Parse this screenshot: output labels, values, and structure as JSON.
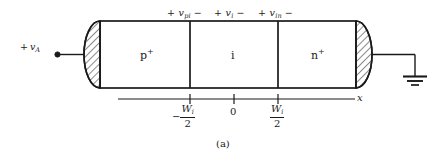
{
  "figure": {
    "caption": "(a)",
    "device": "PIN diode one-dimensional structure",
    "terminal_voltage": {
      "sign": "+",
      "symbol": "v",
      "subscript": "A"
    },
    "ground": {
      "name": "ground-symbol",
      "bars": 3
    },
    "regions": [
      {
        "id": "p-plus",
        "label": "p",
        "superscript": "+"
      },
      {
        "id": "intrinsic",
        "label": "i",
        "superscript": ""
      },
      {
        "id": "n-plus",
        "label": "n",
        "superscript": "+"
      }
    ],
    "region_voltages": [
      {
        "id": "v-pi",
        "plus": "+",
        "symbol": "v",
        "subscript": "pi",
        "minus": "−"
      },
      {
        "id": "v-i",
        "plus": "+",
        "symbol": "v",
        "subscript": "i",
        "minus": "−"
      },
      {
        "id": "v-in",
        "plus": "+",
        "symbol": "v",
        "subscript": "in",
        "minus": "−"
      }
    ],
    "axis": {
      "name": "x",
      "ticks": [
        {
          "id": "tick-neg-half-wi",
          "minus": "−",
          "numerator": "W",
          "numerator_sub": "i",
          "denominator": "2"
        },
        {
          "id": "tick-zero",
          "text": "0"
        },
        {
          "id": "tick-pos-half-wi",
          "minus": "",
          "numerator": "W",
          "numerator_sub": "i",
          "denominator": "2"
        }
      ]
    },
    "colors": {
      "line": "#1a1a1a",
      "background": "#ffffff",
      "hatch": "#2b2b2b"
    }
  }
}
